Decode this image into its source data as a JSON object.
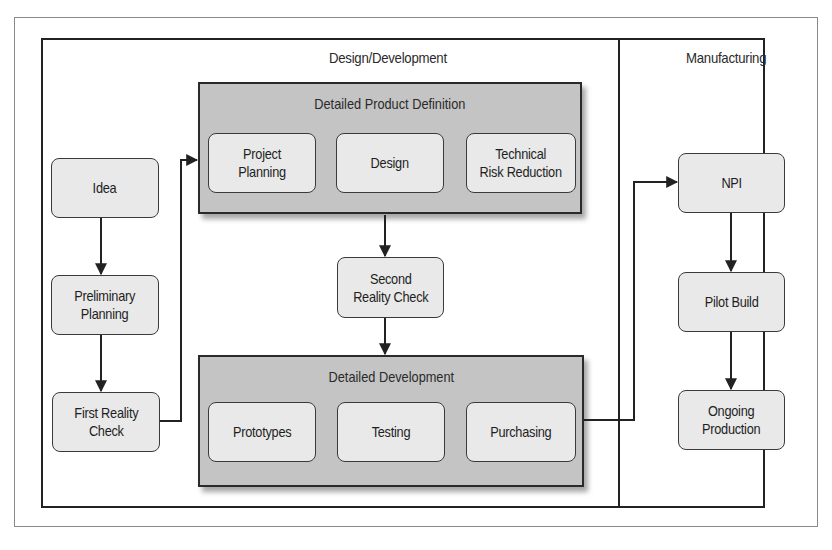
{
  "sections": {
    "design_development": "Design/Development",
    "manufacturing": "Manufacturing"
  },
  "groups": {
    "product_definition": {
      "title": "Detailed Product Definition",
      "items": [
        "Project\nPlanning",
        "Design",
        "Technical\nRisk Reduction"
      ]
    },
    "development": {
      "title": "Detailed Development",
      "items": [
        "Prototypes",
        "Testing",
        "Purchasing"
      ]
    }
  },
  "nodes": {
    "idea": "Idea",
    "preliminary_planning": "Preliminary\nPlanning",
    "first_reality_check": "First Reality\nCheck",
    "second_reality_check": "Second\nReality Check",
    "npi": "NPI",
    "pilot_build": "Pilot Build",
    "ongoing_production": "Ongoing\nProduction"
  },
  "colors": {
    "group_fill": "#c4c4c4",
    "node_fill": "#e9e9e9",
    "line": "#222222"
  }
}
